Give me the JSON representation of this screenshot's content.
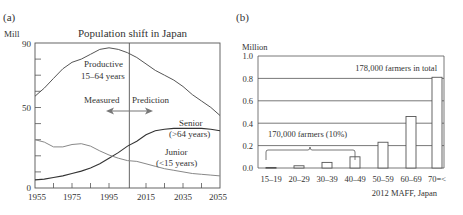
{
  "chart_data": [
    {
      "panel": "(a)",
      "type": "line",
      "title": "Population shift in Japan",
      "ylabel": "Mill",
      "xlabel": "",
      "ylim": [
        0,
        90
      ],
      "xlim": [
        1955,
        2055
      ],
      "yticks": [
        0,
        50,
        90
      ],
      "xticks": [
        1955,
        1975,
        1995,
        2015,
        2035,
        2055
      ],
      "divider_year": 2006,
      "annotations": [
        "Measured",
        "Prediction"
      ],
      "series": [
        {
          "name": "Productive 15–64 years",
          "label1": "Productive",
          "label2": "15–64 years",
          "x": [
            1955,
            1960,
            1965,
            1970,
            1975,
            1980,
            1985,
            1990,
            1995,
            2000,
            2005,
            2010,
            2015,
            2020,
            2025,
            2030,
            2035,
            2040,
            2045,
            2050,
            2055
          ],
          "values": [
            57,
            62,
            68,
            74,
            78,
            80,
            83,
            86,
            87,
            86,
            84,
            81,
            77,
            73,
            70,
            67,
            63,
            58,
            54,
            50,
            45
          ]
        },
        {
          "name": "Senior (>64 years)",
          "label1": "Senior",
          "label2": "(>64 years)",
          "x": [
            1955,
            1960,
            1965,
            1970,
            1975,
            1980,
            1985,
            1990,
            1995,
            2000,
            2005,
            2010,
            2015,
            2020,
            2025,
            2030,
            2035,
            2040,
            2045,
            2050,
            2055
          ],
          "values": [
            5,
            5.5,
            6.5,
            7.5,
            9,
            10.5,
            12.5,
            15,
            18.5,
            22,
            26,
            29,
            33,
            35.5,
            36.5,
            37,
            37,
            37,
            37,
            36.5,
            35.5
          ]
        },
        {
          "name": "Junior (<15 years)",
          "label1": "Junior",
          "label2": "(<15 years)",
          "x": [
            1955,
            1960,
            1965,
            1970,
            1975,
            1980,
            1985,
            1990,
            1995,
            2000,
            2005,
            2010,
            2015,
            2020,
            2025,
            2030,
            2035,
            2040,
            2045,
            2050,
            2055
          ],
          "values": [
            30,
            28.5,
            25.5,
            25.5,
            27,
            27.5,
            26,
            23,
            20.5,
            18.5,
            17,
            16.5,
            15,
            13.5,
            12,
            11,
            10,
            9,
            8.5,
            8,
            7.5
          ]
        }
      ]
    },
    {
      "panel": "(b)",
      "type": "bar",
      "title": "",
      "ylabel": "Million",
      "xlabel": "",
      "ylim": [
        0,
        1.0
      ],
      "yticks": [
        "0.0",
        "0.2",
        "0.4",
        "0.6",
        "0.8",
        "1.0"
      ],
      "categories": [
        "15–19",
        "20–29",
        "30–39",
        "40–49",
        "50–59",
        "60–69",
        "70=<"
      ],
      "values": [
        0.005,
        0.02,
        0.05,
        0.1,
        0.23,
        0.46,
        0.81
      ],
      "grid": true,
      "annotations": [
        "178,000 farmers in total",
        "170,000 farmers (10%)"
      ],
      "source": "2012 MAFF, Japan"
    }
  ],
  "panel_a": {
    "tag": "(a)",
    "title": "Population shift in Japan",
    "unit": "Mill",
    "y_ticks": [
      "90",
      "50",
      "0"
    ],
    "x_ticks": [
      "1955",
      "1975",
      "1995",
      "2015",
      "2035",
      "2055"
    ],
    "measured": "Measured",
    "prediction": "Prediction",
    "productive_1": "Productive",
    "productive_2": "15–64 years",
    "senior_1": "Senior",
    "senior_2": "(>64 years)",
    "junior_1": "Junior",
    "junior_2": "(<15 years)"
  },
  "panel_b": {
    "tag": "(b)",
    "unit": "Million",
    "y_ticks": [
      "1.0",
      "0.8",
      "0.6",
      "0.4",
      "0.2",
      "0.0"
    ],
    "categories": [
      "15–19",
      "20–29",
      "30–39",
      "40–49",
      "50–59",
      "60–69",
      "70=<"
    ],
    "total_note": "178,000 farmers in total",
    "young_note": "170,000 farmers (10%)",
    "source": "2012 MAFF, Japan"
  }
}
